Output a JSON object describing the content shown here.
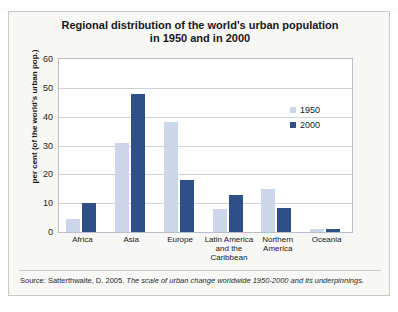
{
  "scan": {
    "top_artifact_text": "·· · ··· ·      ·        ·"
  },
  "figure": {
    "title_line1": "Regional distribution of the world's urban population",
    "title_line2": "in 1950 and in 2000",
    "y_axis_title": "per cent (of the world's urban pop.)",
    "source_prefix": "Source: Satterthwaite, D. 2005. ",
    "source_italic": "The scale of urban change worldwide 1950-2000 and its underpinnings."
  },
  "legend": {
    "items": [
      {
        "label": "1950",
        "color": "#ccd6ea"
      },
      {
        "label": "2000",
        "color": "#2f4f86"
      }
    ]
  },
  "chart_data": {
    "type": "bar",
    "title": "Regional distribution of the world's urban population in 1950 and in 2000",
    "xlabel": "",
    "ylabel": "per cent (of the world's urban pop.)",
    "ylim": [
      0,
      60
    ],
    "yticks": [
      0,
      10,
      20,
      30,
      40,
      50,
      60
    ],
    "grid": true,
    "legend_position": "right-inside",
    "categories": [
      "Africa",
      "Asia",
      "Europe",
      "Latin America and the Caribbean",
      "Northern America",
      "Oceania"
    ],
    "category_label_lines": [
      [
        "Africa"
      ],
      [
        "Asia"
      ],
      [
        "Europe"
      ],
      [
        "Latin America",
        "and the",
        "Caribbean"
      ],
      [
        "Northern",
        "America"
      ],
      [
        "Oceania"
      ]
    ],
    "series": [
      {
        "name": "1950",
        "color": "#ccd6ea",
        "values": [
          4.5,
          31,
          38,
          8,
          15,
          1
        ]
      },
      {
        "name": "2000",
        "color": "#2f4f86",
        "values": [
          10,
          48,
          18,
          13,
          8.5,
          1
        ]
      }
    ]
  }
}
